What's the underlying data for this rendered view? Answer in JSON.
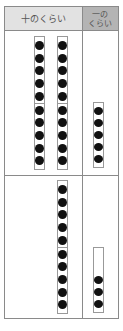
{
  "header": {
    "tens_label": "十のくらい",
    "ones_label_line1": "一の",
    "ones_label_line2": "くらい"
  },
  "colors": {
    "tens_header_bg": "#e2e2e2",
    "ones_header_bg": "#b4b4b4",
    "dot": "#111111",
    "border": "#8a8a8a"
  },
  "rows": [
    {
      "tens_rods": 2,
      "ones_dots": 5,
      "ones_slots": 5,
      "value": 25
    },
    {
      "tens_rods": 1,
      "ones_dots": 3,
      "ones_slots": 5,
      "value": 13
    }
  ]
}
